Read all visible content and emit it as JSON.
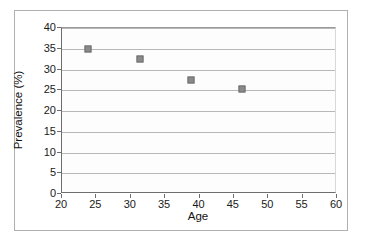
{
  "chart_data": {
    "type": "scatter",
    "title": "",
    "xlabel": "Age",
    "ylabel": "Prevalence (%)",
    "xlim": [
      20,
      60
    ],
    "ylim": [
      0,
      40
    ],
    "xticks": [
      20,
      25,
      30,
      35,
      40,
      45,
      50,
      55,
      60
    ],
    "xtick_labels": [
      "20",
      "25",
      "30",
      "35",
      "40",
      "45",
      "50",
      "55",
      "60"
    ],
    "yticks": [
      0,
      5,
      10,
      15,
      20,
      25,
      30,
      35,
      40
    ],
    "ytick_labels": [
      "0",
      "5",
      "10",
      "15",
      "20",
      "25",
      "30",
      "35",
      "40"
    ],
    "grid": "horizontal",
    "legend": "none",
    "marker_shape": "square",
    "marker_color": "#8a8a8a",
    "marker_edge_color": "#6f6f6f",
    "series": [
      {
        "name": "Prevalence by age",
        "points": [
          {
            "x": 23.8,
            "y": 35.0
          },
          {
            "x": 31.3,
            "y": 32.5
          },
          {
            "x": 38.7,
            "y": 27.4
          },
          {
            "x": 46.2,
            "y": 25.2
          }
        ]
      }
    ]
  },
  "colors": {
    "background": "#ffffff",
    "plot_background": "#fdfdfd",
    "gridline": "#b8b8b8",
    "axis": "#6e6e6e",
    "frame": "#b0b0b0",
    "text": "#111111"
  }
}
